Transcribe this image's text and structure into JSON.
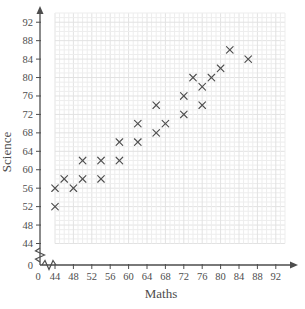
{
  "chart_data": {
    "type": "scatter",
    "title": "",
    "xlabel": "Maths",
    "ylabel": "Science",
    "marker": "x",
    "grid": true,
    "legend": "none",
    "axis_break_near_origin": true,
    "x_origin_label": "0",
    "y_origin_label": "0",
    "x_ticks": [
      44,
      48,
      52,
      56,
      60,
      64,
      68,
      72,
      76,
      80,
      84,
      88,
      92
    ],
    "y_ticks": [
      44,
      48,
      52,
      56,
      60,
      64,
      68,
      72,
      76,
      80,
      84,
      88,
      92
    ],
    "xlim": [
      44,
      94
    ],
    "ylim": [
      44,
      94
    ],
    "points": [
      [
        44,
        52
      ],
      [
        44,
        56
      ],
      [
        46,
        58
      ],
      [
        48,
        56
      ],
      [
        50,
        58
      ],
      [
        50,
        62
      ],
      [
        54,
        58
      ],
      [
        54,
        62
      ],
      [
        58,
        62
      ],
      [
        58,
        66
      ],
      [
        62,
        66
      ],
      [
        62,
        70
      ],
      [
        66,
        68
      ],
      [
        66,
        74
      ],
      [
        68,
        70
      ],
      [
        72,
        72
      ],
      [
        72,
        76
      ],
      [
        74,
        80
      ],
      [
        76,
        74
      ],
      [
        76,
        78
      ],
      [
        78,
        80
      ],
      [
        80,
        82
      ],
      [
        82,
        86
      ],
      [
        86,
        84
      ]
    ],
    "colors": {
      "axis": "#4d4d4d",
      "text": "#4d4d4d",
      "marker": "#4f4f4f",
      "grid_minor": "#ededed",
      "grid_major": "#e2e2e2",
      "background": "#ffffff"
    }
  }
}
